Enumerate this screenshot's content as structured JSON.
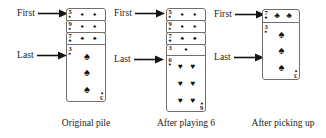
{
  "figure": {
    "background": "#ffffff",
    "ink": "#1a1a1a",
    "card_border": "#6f6f6f"
  },
  "labels": {
    "first": "First",
    "last": "Last",
    "arrow_icon": "right-arrow-icon"
  },
  "panels": [
    {
      "id": "original-pile",
      "caption": "Original pile",
      "first_label": "First",
      "last_label": "Last",
      "cards": [
        {
          "rank": "5",
          "suit": "♠",
          "suit_name": "spades",
          "visible": "strip",
          "pip_count": 2
        },
        {
          "rank": "9",
          "suit": "♠",
          "suit_name": "spades",
          "visible": "strip",
          "pip_count": 2
        },
        {
          "rank": "7",
          "suit": "♣",
          "suit_name": "clubs",
          "visible": "strip",
          "pip_count": 2
        },
        {
          "rank": "3",
          "suit": "♠",
          "suit_name": "spades",
          "visible": "full",
          "pip_count": 3
        }
      ]
    },
    {
      "id": "after-playing-6",
      "caption": "After playing 6",
      "first_label": "First",
      "last_label": "Last",
      "cards": [
        {
          "rank": "5",
          "suit": "♠",
          "suit_name": "spades",
          "visible": "strip",
          "pip_count": 2
        },
        {
          "rank": "9",
          "suit": "♠",
          "suit_name": "spades",
          "visible": "strip",
          "pip_count": 2
        },
        {
          "rank": "7",
          "suit": "♣",
          "suit_name": "clubs",
          "visible": "strip",
          "pip_count": 2
        },
        {
          "rank": "3",
          "suit": "♠",
          "suit_name": "spades",
          "visible": "strip",
          "pip_count": 1
        },
        {
          "rank": "6",
          "suit": "♥",
          "suit_name": "hearts",
          "visible": "full",
          "pip_count": 6
        }
      ]
    },
    {
      "id": "after-picking-up",
      "caption": "After picking up",
      "first_label": "First",
      "last_label": "Last",
      "cards": [
        {
          "rank": "7",
          "suit": "♣",
          "suit_name": "clubs",
          "visible": "strip",
          "pip_count": 2
        },
        {
          "rank": "3",
          "suit": "♠",
          "suit_name": "spades",
          "visible": "full",
          "pip_count": 3
        }
      ]
    }
  ]
}
